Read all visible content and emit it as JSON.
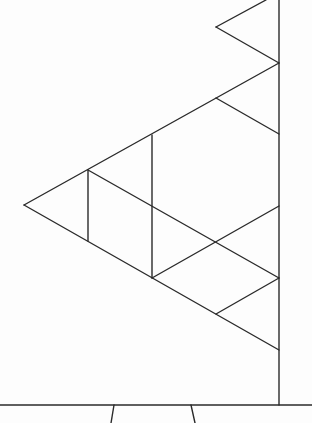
{
  "canvas": {
    "width": 312,
    "height": 423,
    "background": "#fdfdfd",
    "stroke_color": "#2a2a2a",
    "stroke_width": 1.4
  },
  "diagram": {
    "segments": [
      {
        "name": "right-vertical-line",
        "x1": 279,
        "y1": 0,
        "x2": 279,
        "y2": 405
      },
      {
        "name": "baseline",
        "x1": 0,
        "y1": 405,
        "x2": 312,
        "y2": 405
      },
      {
        "name": "top-triangle-upper-edge",
        "x1": 266,
        "y1": 0,
        "x2": 216,
        "y2": 27
      },
      {
        "name": "top-triangle-lower-edge",
        "x1": 216,
        "y1": 27,
        "x2": 279,
        "y2": 63
      },
      {
        "name": "big-triangle-upper-edge",
        "x1": 279,
        "y1": 63,
        "x2": 24,
        "y2": 205
      },
      {
        "name": "big-triangle-lower-edge",
        "x1": 24,
        "y1": 205,
        "x2": 279,
        "y2": 350
      },
      {
        "name": "inner-vertical-left",
        "x1": 88,
        "y1": 170,
        "x2": 88,
        "y2": 241
      },
      {
        "name": "inner-vertical-middle",
        "x1": 152,
        "y1": 135,
        "x2": 152,
        "y2": 278
      },
      {
        "name": "upper-right-diagonal",
        "x1": 216,
        "y1": 98,
        "x2": 279,
        "y2": 134
      },
      {
        "name": "long-inner-diagonal",
        "x1": 88,
        "y1": 170,
        "x2": 279,
        "y2": 278
      },
      {
        "name": "rising-inner-diagonal",
        "x1": 152,
        "y1": 278,
        "x2": 279,
        "y2": 206
      },
      {
        "name": "lower-right-diagonal",
        "x1": 216,
        "y1": 314,
        "x2": 279,
        "y2": 278
      },
      {
        "name": "trapezoid-left-leg",
        "x1": 114,
        "y1": 405,
        "x2": 111,
        "y2": 423
      },
      {
        "name": "trapezoid-right-leg",
        "x1": 191,
        "y1": 405,
        "x2": 195,
        "y2": 423
      }
    ],
    "vertices": [
      {
        "name": "top-left-notch",
        "x": 216,
        "y": 27
      },
      {
        "name": "upper-junction",
        "x": 279,
        "y": 63
      },
      {
        "name": "left-apex",
        "x": 24,
        "y": 205
      },
      {
        "name": "lower-junction",
        "x": 279,
        "y": 350
      },
      {
        "name": "crossing-point",
        "x": 215,
        "y": 242
      }
    ]
  }
}
